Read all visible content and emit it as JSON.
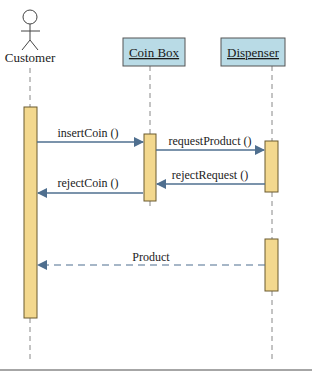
{
  "diagram": {
    "type": "sequence",
    "colors": {
      "object_fill": "#b9dbe6",
      "object_border": "#555555",
      "activation_fill": "#f3d88e",
      "activation_border": "#6b5a2e",
      "message": "#4f6f8f",
      "lifeline": "#888888",
      "bottom_rule": "#888888"
    },
    "actor": {
      "name": "Customer"
    },
    "objects": [
      {
        "name": "Coin Box"
      },
      {
        "name": "Dispenser"
      }
    ],
    "messages": [
      {
        "label": "insertCoin ()",
        "from": "Customer",
        "to": "Coin Box",
        "style": "sync"
      },
      {
        "label": "requestProduct ()",
        "from": "Coin Box",
        "to": "Dispenser",
        "style": "sync"
      },
      {
        "label": "rejectRequest ()",
        "from": "Dispenser",
        "to": "Coin Box",
        "style": "sync"
      },
      {
        "label": "rejectCoin ()",
        "from": "Coin Box",
        "to": "Customer",
        "style": "sync"
      },
      {
        "label": "Product",
        "from": "Dispenser",
        "to": "Customer",
        "style": "return"
      }
    ]
  }
}
